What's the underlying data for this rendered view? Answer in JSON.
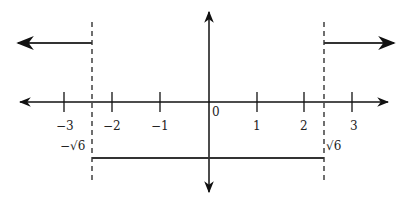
{
  "diagram": {
    "title": "",
    "x_axis": {
      "ticks": [
        {
          "value": -3,
          "label": "−3",
          "px": 64
        },
        {
          "value": -2,
          "label": "−2",
          "px": 112
        },
        {
          "value": -1,
          "label": "−1",
          "px": 160
        },
        {
          "value": 0,
          "label": "0",
          "px": 209
        },
        {
          "value": 1,
          "label": "1",
          "px": 257
        },
        {
          "value": 2,
          "label": "2",
          "px": 304
        },
        {
          "value": 3,
          "label": "3",
          "px": 352
        }
      ]
    },
    "boundaries": [
      {
        "label": "−√6",
        "value": -2.449
      },
      {
        "label": "√6",
        "value": 2.449
      }
    ],
    "pieces": [
      {
        "from": "-inf",
        "to": "-sqrt6",
        "level": "upper",
        "direction": "left-arrow"
      },
      {
        "from": "-sqrt6",
        "to": "sqrt6",
        "level": "lower",
        "direction": "segment"
      },
      {
        "from": "sqrt6",
        "to": "+inf",
        "level": "upper",
        "direction": "right-arrow"
      }
    ],
    "colors": {
      "axis": "#111111",
      "graph": "#333333",
      "dash": "#222222"
    }
  }
}
